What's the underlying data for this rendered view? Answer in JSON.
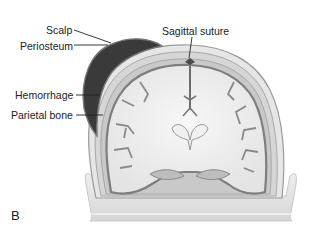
{
  "figure": {
    "panel_letter": "B",
    "labels": {
      "scalp": "Scalp",
      "periosteum": "Periosteum",
      "hemorrhage": "Hemorrhage",
      "parietal_bone": "Parietal bone",
      "sagittal_suture": "Sagittal suture"
    },
    "colors": {
      "hemorrhage": "#3a3a3a",
      "bone": "#d9d9d9",
      "cortex": "#8a8a8a",
      "white_matter": "#efefef",
      "base": "#e2e2e2"
    }
  }
}
